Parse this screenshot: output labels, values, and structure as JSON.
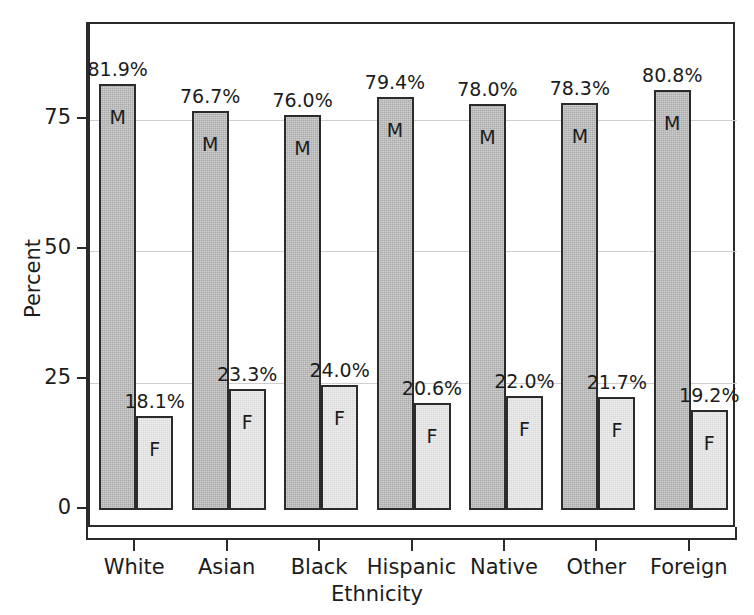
{
  "chart_data": {
    "type": "bar",
    "title": "",
    "xlabel": "Ethnicity",
    "ylabel": "Percent",
    "ylim": [
      0,
      90
    ],
    "yticks": [
      0,
      25,
      50,
      75
    ],
    "ytick_labels": [
      "0",
      "25",
      "50",
      "75"
    ],
    "grid": true,
    "grid_axis": "y",
    "legend": "in-bar letters",
    "categories": [
      "White",
      "Asian",
      "Black",
      "Hispanic",
      "Native",
      "Other",
      "Foreign"
    ],
    "series": [
      {
        "name": "M",
        "letter": "M",
        "color": "#a9a9a9",
        "values": [
          81.9,
          76.7,
          76.0,
          79.4,
          78.0,
          78.3,
          80.8
        ],
        "labels": [
          "81.9%",
          "76.7%",
          "76.0%",
          "79.4%",
          "78.0%",
          "78.3%",
          "80.8%"
        ]
      },
      {
        "name": "F",
        "letter": "F",
        "color": "#d9d9d9",
        "values": [
          18.1,
          23.3,
          24.0,
          20.6,
          22.0,
          21.7,
          19.2
        ],
        "labels": [
          "18.1%",
          "23.3%",
          "24.0%",
          "20.6%",
          "22.0%",
          "21.7%",
          "19.2%"
        ]
      }
    ]
  },
  "axes": {
    "y_title": "Percent",
    "x_title": "Ethnicity",
    "y_tick_0": "0",
    "y_tick_1": "25",
    "y_tick_2": "50",
    "y_tick_3": "75"
  },
  "colors": {
    "male_bar": "#a9a9a9",
    "female_bar": "#d9d9d9",
    "bar_outline": "#2b2b2b",
    "gridline": "#cfcfcf",
    "axis": "#2b2b2b",
    "text": "#1c1c1c",
    "background": "#ffffff"
  }
}
